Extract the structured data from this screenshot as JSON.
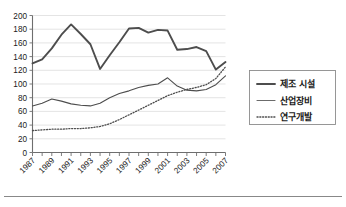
{
  "chart_data": {
    "type": "line",
    "title": "",
    "xlabel": "",
    "ylabel": "",
    "ylim": [
      0,
      200
    ],
    "ytick_values": [
      0,
      20,
      40,
      60,
      80,
      100,
      120,
      140,
      160,
      180,
      200
    ],
    "ytick_labels": [
      "0",
      "20",
      "40",
      "60",
      "80",
      "100",
      "120",
      "140",
      "160",
      "180",
      "200"
    ],
    "grid": true,
    "grid_axis": "y",
    "legend_position": "right",
    "x": [
      1987,
      1988,
      1989,
      1990,
      1991,
      1992,
      1993,
      1994,
      1995,
      1996,
      1997,
      1998,
      1999,
      2000,
      2001,
      2002,
      2003,
      2004,
      2005,
      2006,
      2007
    ],
    "xtick_labels": [
      "1987",
      "1989",
      "1991",
      "1993",
      "1995",
      "1997",
      "1999",
      "2001",
      "2003",
      "2005",
      "2007"
    ],
    "xtick_label_years": [
      1987,
      1989,
      1991,
      1993,
      1995,
      1997,
      1999,
      2001,
      2003,
      2005,
      2007
    ],
    "series": [
      {
        "name": "제조 시설",
        "style": "solid-thick",
        "color": "#4d4d4d",
        "width": 1.9,
        "values": [
          130,
          136,
          152,
          172,
          187,
          173,
          158,
          122,
          142,
          161,
          181,
          182,
          175,
          179,
          178,
          150,
          151,
          154,
          148,
          121,
          132
        ]
      },
      {
        "name": "산업장비",
        "style": "solid-thin",
        "color": "#6b6b6b",
        "width": 1.1,
        "values": [
          68,
          72,
          78,
          75,
          71,
          69,
          68,
          72,
          80,
          86,
          90,
          95,
          98,
          100,
          109,
          97,
          91,
          90,
          92,
          99,
          112
        ]
      },
      {
        "name": "연구개발",
        "style": "dotted",
        "color": "#4d4d4d",
        "width": 1.3,
        "values": [
          32,
          33,
          34,
          34,
          35,
          35,
          36,
          38,
          42,
          48,
          55,
          62,
          69,
          76,
          83,
          88,
          92,
          95,
          99,
          108,
          125
        ]
      }
    ]
  },
  "legend": {
    "entries": [
      {
        "label": "제조 시설",
        "style": "solid-thick"
      },
      {
        "label": "산업장비",
        "style": "solid-thin"
      },
      {
        "label": "연구개발",
        "style": "dotted"
      }
    ]
  }
}
